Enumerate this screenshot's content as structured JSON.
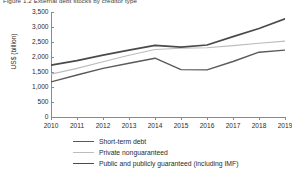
{
  "figure": {
    "clipped_title": "Figure 1.2  External debt stocks by creditor type",
    "ylabel": "US$ (billion)"
  },
  "chart_data": {
    "type": "line",
    "title": "",
    "xlabel": "",
    "ylabel": "US$ (billion)",
    "x": [
      2010,
      2011,
      2012,
      2013,
      2014,
      2015,
      2016,
      2017,
      2018,
      2019
    ],
    "xtick_labels": [
      "2010",
      "2011",
      "2012",
      "2013",
      "2014",
      "2015",
      "2016",
      "2017",
      "2018",
      "2019"
    ],
    "ytick_labels": [
      "0",
      "500",
      "1,000",
      "1,500",
      "2,000",
      "2,500",
      "3,000",
      "3,500"
    ],
    "yticks": [
      0,
      500,
      1000,
      1500,
      2000,
      2500,
      3000,
      3500
    ],
    "ylim": [
      0,
      3500
    ],
    "xlim": [
      2010,
      2019
    ],
    "grid": false,
    "legend_position": "below",
    "series": [
      {
        "name": "Short-term debt",
        "color": "#5a5a5a",
        "values": [
          1170,
          1400,
          1620,
          1790,
          1960,
          1580,
          1570,
          1850,
          2160,
          2230
        ]
      },
      {
        "name": "Private nonguaranteed",
        "color": "#bcbcbc",
        "values": [
          1430,
          1620,
          1840,
          2060,
          2250,
          2290,
          2310,
          2380,
          2460,
          2530
        ]
      },
      {
        "name": "Public and publicly guaranteed (including IMF)",
        "color": "#4a4a4a",
        "values": [
          1730,
          1880,
          2060,
          2230,
          2390,
          2330,
          2400,
          2680,
          2950,
          3270
        ]
      }
    ]
  },
  "legend": [
    {
      "label": "Short-term debt",
      "color": "#5a5a5a",
      "width": 1.5
    },
    {
      "label": "Private nonguaranteed",
      "color": "#bcbcbc",
      "width": 1.1
    },
    {
      "label": "Public and publicly guaranteed (including IMF)",
      "color": "#4a4a4a",
      "width": 1.8
    }
  ]
}
